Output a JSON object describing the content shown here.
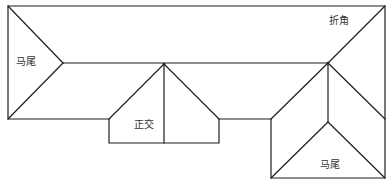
{
  "diagram": {
    "type": "roof-plan",
    "labels": {
      "hip_left": "马尾",
      "corner_top_right": "折角",
      "orthogonal_center": "正交",
      "hip_bottom_right": "马尾"
    },
    "colors": {
      "line": "#1e1e1e",
      "text": "#333333",
      "background": "#ffffff"
    }
  }
}
